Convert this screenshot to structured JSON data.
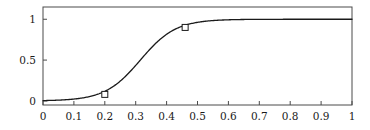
{
  "chart_data": {
    "type": "line",
    "title": "",
    "subtitle": "",
    "xlabel": "",
    "ylabel": "",
    "xlim": [
      0,
      1
    ],
    "ylim": [
      -0.05,
      1.15
    ],
    "grid": false,
    "legend": null,
    "frame": true,
    "series": [
      {
        "name": "logistic-curve",
        "type": "line",
        "color": "#1a1a1a",
        "linewidth": 1.3,
        "x": [
          0.0,
          0.02,
          0.04,
          0.06,
          0.08,
          0.1,
          0.12,
          0.14,
          0.16,
          0.18,
          0.2,
          0.22,
          0.24,
          0.26,
          0.28,
          0.3,
          0.32,
          0.34,
          0.36,
          0.38,
          0.4,
          0.42,
          0.44,
          0.46,
          0.48,
          0.5,
          0.52,
          0.54,
          0.56,
          0.58,
          0.6,
          0.64,
          0.68,
          0.72,
          0.76,
          0.8,
          0.84,
          0.88,
          0.92,
          0.96,
          1.0
        ],
        "y": [
          0.008,
          0.011,
          0.015,
          0.021,
          0.029,
          0.04,
          0.054,
          0.073,
          0.098,
          0.13,
          0.08,
          0.225,
          0.287,
          0.36,
          0.44,
          0.523,
          0.604,
          0.679,
          0.745,
          0.8,
          0.845,
          0.88,
          0.907,
          0.9,
          0.945,
          0.958,
          0.968,
          0.976,
          0.982,
          0.986,
          0.989,
          0.994,
          0.996,
          0.998,
          0.999,
          0.999,
          1.0,
          1.0,
          1.0,
          1.0,
          1.0
        ]
      },
      {
        "name": "markers",
        "type": "scatter",
        "marker": "open-square",
        "color": "#1a1a1a",
        "points": [
          {
            "x": 0.2,
            "y": 0.08
          },
          {
            "x": 0.46,
            "y": 0.9
          }
        ]
      }
    ],
    "xticks": [
      0,
      0.1,
      0.2,
      0.3,
      0.4,
      0.5,
      0.6,
      0.7,
      0.8,
      0.9,
      1
    ],
    "xticklabels": [
      "0",
      "0.1",
      "0.2",
      "0.3",
      "0.4",
      "0.5",
      "0.6",
      "0.7",
      "0.8",
      "0.9",
      "1"
    ],
    "yticks": [
      0,
      0.5,
      1
    ],
    "yticklabels": [
      "0",
      "0.5",
      "1"
    ],
    "axis_color": "#4a4a4a",
    "background": "#ffffff"
  }
}
